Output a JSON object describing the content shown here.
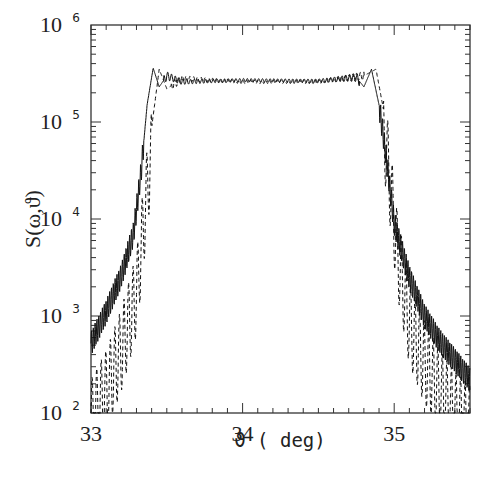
{
  "chart_data": {
    "type": "line",
    "title": "",
    "xlabel": "ϑ ( deg)",
    "ylabel": "S(ω,ϑ)",
    "xlim": [
      33,
      35.5
    ],
    "ylim": [
      100,
      1000000
    ],
    "yscale": "log",
    "grid": false,
    "legend": "none",
    "x_ticks": [
      {
        "value": 33,
        "label": "33"
      },
      {
        "value": 34,
        "label": "34"
      },
      {
        "value": 35,
        "label": "35"
      }
    ],
    "y_ticks": [
      {
        "value": 100,
        "base": "10",
        "exp": "2"
      },
      {
        "value": 1000,
        "base": "10",
        "exp": "3"
      },
      {
        "value": 10000,
        "base": "10",
        "exp": "4"
      },
      {
        "value": 100000,
        "base": "10",
        "exp": "5"
      },
      {
        "value": 1000000,
        "base": "10",
        "exp": "6"
      }
    ],
    "series": [
      {
        "name": "solid",
        "style": "solid",
        "description": "Flat-top spectrum with Gibbs-like ripple near edges, smooth decaying tails",
        "plateau_level": 270000,
        "edge_peak": 360000,
        "left_edge_deg": 33.4,
        "right_edge_deg": 34.85,
        "points": [
          [
            33.0,
            520
          ],
          [
            33.1,
            1100
          ],
          [
            33.2,
            2600
          ],
          [
            33.28,
            7000
          ],
          [
            33.33,
            30000
          ],
          [
            33.37,
            150000
          ],
          [
            33.41,
            360000
          ],
          [
            33.45,
            230000
          ],
          [
            33.5,
            300000
          ],
          [
            33.6,
            260000
          ],
          [
            34.0,
            270000
          ],
          [
            34.5,
            265000
          ],
          [
            34.75,
            290000
          ],
          [
            34.8,
            230000
          ],
          [
            34.85,
            350000
          ],
          [
            34.9,
            150000
          ],
          [
            34.95,
            40000
          ],
          [
            35.0,
            9000
          ],
          [
            35.1,
            2500
          ],
          [
            35.2,
            1000
          ],
          [
            35.3,
            550
          ],
          [
            35.4,
            350
          ],
          [
            35.5,
            220
          ]
        ]
      },
      {
        "name": "dashed",
        "style": "dashed",
        "description": "Shifted spectrum with strong oscillations in the tails",
        "plateau_level": 260000,
        "edge_peak": 350000,
        "left_edge_deg": 33.45,
        "right_edge_deg": 34.88,
        "points": [
          [
            33.0,
            150
          ],
          [
            33.1,
            300
          ],
          [
            33.2,
            800
          ],
          [
            33.3,
            3000
          ],
          [
            33.38,
            50000
          ],
          [
            33.45,
            350000
          ],
          [
            33.5,
            220000
          ],
          [
            33.6,
            280000
          ],
          [
            34.0,
            260000
          ],
          [
            34.5,
            260000
          ],
          [
            34.8,
            300000
          ],
          [
            34.88,
            350000
          ],
          [
            34.95,
            90000
          ],
          [
            35.02,
            8000
          ],
          [
            35.1,
            1500
          ],
          [
            35.2,
            600
          ],
          [
            35.3,
            300
          ],
          [
            35.4,
            180
          ],
          [
            35.5,
            130
          ]
        ]
      }
    ]
  }
}
